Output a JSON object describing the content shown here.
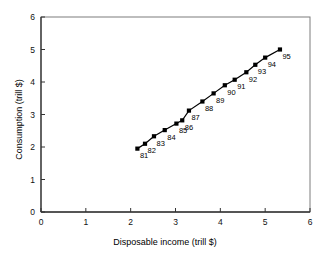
{
  "chart_data": {
    "type": "scatter",
    "title": "",
    "xlabel": "Disposable income (trill $)",
    "ylabel": "Consumption (trill $)",
    "xlim": [
      0,
      6
    ],
    "ylim": [
      0,
      6
    ],
    "xticks": [
      "0",
      "1",
      "2",
      "3",
      "4",
      "5",
      "6"
    ],
    "yticks": [
      "0",
      "1",
      "2",
      "3",
      "4",
      "5",
      "6"
    ],
    "grid": false,
    "legend": "none",
    "line_style": "solid",
    "marker": "square",
    "marker_color": "#000000",
    "line_color": "#000000",
    "point_labels": [
      "81",
      "82",
      "83",
      "84",
      "85",
      "86",
      "87",
      "88",
      "89",
      "90",
      "91",
      "92",
      "93",
      "94",
      "95"
    ],
    "x": [
      2.15,
      2.32,
      2.52,
      2.76,
      3.02,
      3.15,
      3.3,
      3.6,
      3.85,
      4.1,
      4.32,
      4.58,
      4.78,
      5.0,
      5.33
    ],
    "y": [
      1.95,
      2.1,
      2.33,
      2.52,
      2.72,
      2.82,
      3.12,
      3.4,
      3.65,
      3.9,
      4.07,
      4.3,
      4.53,
      4.75,
      5.0
    ],
    "series": [
      {
        "name": "Consumption vs disposable income",
        "points": [
          {
            "label": "81",
            "x": 2.15,
            "y": 1.95
          },
          {
            "label": "82",
            "x": 2.32,
            "y": 2.1
          },
          {
            "label": "83",
            "x": 2.52,
            "y": 2.33
          },
          {
            "label": "84",
            "x": 2.76,
            "y": 2.52
          },
          {
            "label": "85",
            "x": 3.02,
            "y": 2.72
          },
          {
            "label": "86",
            "x": 3.15,
            "y": 2.82
          },
          {
            "label": "87",
            "x": 3.3,
            "y": 3.12
          },
          {
            "label": "88",
            "x": 3.6,
            "y": 3.4
          },
          {
            "label": "89",
            "x": 3.85,
            "y": 3.65
          },
          {
            "label": "90",
            "x": 4.1,
            "y": 3.9
          },
          {
            "label": "91",
            "x": 4.32,
            "y": 4.07
          },
          {
            "label": "92",
            "x": 4.58,
            "y": 4.3
          },
          {
            "label": "93",
            "x": 4.78,
            "y": 4.53
          },
          {
            "label": "94",
            "x": 5.0,
            "y": 4.75
          },
          {
            "label": "95",
            "x": 5.33,
            "y": 5.0
          }
        ]
      }
    ]
  },
  "axes": {
    "x_title": "Disposable income (trill $)",
    "y_title": "Consumption (trill $)"
  }
}
